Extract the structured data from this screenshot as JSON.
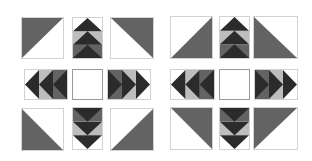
{
  "figure": {
    "colors": {
      "dark": "#2b2b2b",
      "medium": "#636363",
      "light": "#bdbdbd",
      "background": "#ffffff",
      "border": "#d2d2d2"
    }
  },
  "blocks": [
    {
      "name": "left-quilt-block",
      "corners": {
        "top_left": "dark-upper-left",
        "top_right": "dark-upper-right",
        "bottom_left": "dark-lower-left",
        "bottom_right": "dark-lower-right"
      },
      "arrows": {
        "top": "up",
        "bottom": "down",
        "left": "left",
        "right": "right"
      },
      "center": "plain-white"
    },
    {
      "name": "right-quilt-block",
      "corners": {
        "top_left": "dark-lower-right",
        "top_right": "dark-lower-left",
        "bottom_left": "dark-upper-right",
        "bottom_right": "dark-upper-left"
      },
      "arrows": {
        "top": "up",
        "bottom": "down",
        "left": "left",
        "right": "right"
      },
      "center": "plain-white"
    }
  ]
}
